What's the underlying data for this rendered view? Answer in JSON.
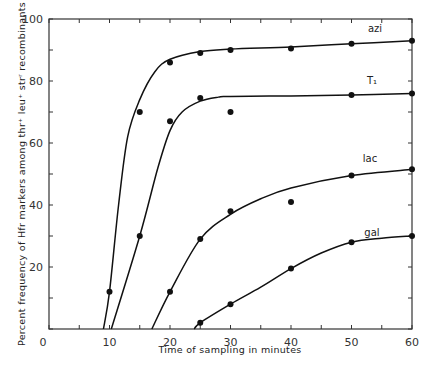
{
  "chart_data": {
    "type": "scatter",
    "title": "",
    "xlabel": "Time of sampling in minutes",
    "ylabel": "Percent frequency of Hfr markers among thr+ leu+ str r recombinants",
    "xlim": [
      0,
      60
    ],
    "ylim": [
      0,
      100
    ],
    "x_ticks": [
      0,
      10,
      20,
      30,
      40,
      50,
      60
    ],
    "y_ticks": [
      0,
      20,
      40,
      60,
      80,
      100
    ],
    "grid": false,
    "legend": "inline labels at curve ends",
    "series": [
      {
        "name": "azi",
        "points": [
          [
            10,
            12
          ],
          [
            15,
            70
          ],
          [
            20,
            86
          ],
          [
            25,
            89
          ],
          [
            30,
            90
          ],
          [
            40,
            90.5
          ],
          [
            50,
            92
          ],
          [
            60,
            93
          ]
        ],
        "curve": [
          [
            9,
            0
          ],
          [
            10,
            12
          ],
          [
            11.5,
            40
          ],
          [
            13,
            62
          ],
          [
            15,
            74
          ],
          [
            17.5,
            83
          ],
          [
            20,
            87
          ],
          [
            25,
            89.5
          ],
          [
            30,
            90.3
          ],
          [
            40,
            91
          ],
          [
            50,
            92
          ],
          [
            60,
            93
          ]
        ]
      },
      {
        "name": "T1",
        "points": [
          [
            15,
            30
          ],
          [
            20,
            67
          ],
          [
            25,
            74.5
          ],
          [
            30,
            70
          ],
          [
            50,
            75.5
          ],
          [
            60,
            76
          ]
        ],
        "curve": [
          [
            10.3,
            0
          ],
          [
            15,
            30
          ],
          [
            18,
            52
          ],
          [
            20,
            64
          ],
          [
            22,
            70
          ],
          [
            25,
            73.5
          ],
          [
            28,
            74.8
          ],
          [
            30,
            75
          ],
          [
            40,
            75.2
          ],
          [
            50,
            75.5
          ],
          [
            60,
            76
          ]
        ]
      },
      {
        "name": "lac",
        "points": [
          [
            20,
            12
          ],
          [
            25,
            29
          ],
          [
            30,
            38
          ],
          [
            40,
            41
          ],
          [
            50,
            49.5
          ],
          [
            60,
            51.5
          ]
        ],
        "curve": [
          [
            17,
            0
          ],
          [
            20,
            12
          ],
          [
            25,
            29
          ],
          [
            30,
            37
          ],
          [
            35,
            42
          ],
          [
            40,
            45.5
          ],
          [
            50,
            49.5
          ],
          [
            60,
            51.5
          ]
        ]
      },
      {
        "name": "gal",
        "points": [
          [
            25,
            2
          ],
          [
            30,
            8
          ],
          [
            40,
            19.5
          ],
          [
            50,
            28
          ],
          [
            60,
            30
          ]
        ],
        "curve": [
          [
            24,
            0
          ],
          [
            25,
            2
          ],
          [
            30,
            8
          ],
          [
            35,
            13.5
          ],
          [
            40,
            19.5
          ],
          [
            45,
            24.5
          ],
          [
            50,
            28
          ],
          [
            55,
            29.3
          ],
          [
            60,
            30
          ]
        ]
      }
    ]
  },
  "labels": {
    "xlabel": "Time of sampling in minutes",
    "ylabel": "Percent frequency of Hfr markers among thr⁺ leu⁺ strʳ recombinants",
    "series": {
      "azi": "azi",
      "T1": "T₁",
      "lac": "lac",
      "gal": "gal"
    }
  }
}
